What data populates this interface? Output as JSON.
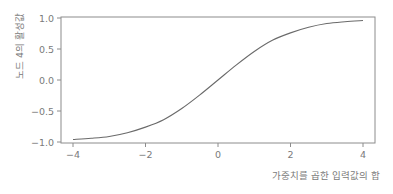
{
  "chart_data": {
    "type": "line",
    "title": "",
    "xlabel": "가중치를 곱한 입력값의 합",
    "ylabel": "노드 4의 활성값",
    "xlim": [
      -4.3,
      4.3
    ],
    "ylim": [
      -1.02,
      1.02
    ],
    "grid": false,
    "legend": null,
    "x_ticks": [
      -4,
      -2,
      0,
      2,
      4
    ],
    "x_tick_labels": [
      "−4",
      "−2",
      "0",
      "2",
      "4"
    ],
    "y_ticks": [
      1.0,
      0.5,
      0.0,
      -0.5,
      -1.0
    ],
    "y_tick_labels": [
      "1.0",
      "0.5",
      "0.0",
      "−0.5",
      "−1.0"
    ],
    "series": [
      {
        "name": "activation (tanh(x/2))",
        "x": [
          -4,
          -3.5,
          -3,
          -2.5,
          -2,
          -1.5,
          -1,
          -0.5,
          0,
          0.5,
          1,
          1.5,
          2,
          2.5,
          3,
          3.5,
          4
        ],
        "y": [
          -0.96,
          -0.94,
          -0.91,
          -0.85,
          -0.76,
          -0.64,
          -0.46,
          -0.24,
          0.0,
          0.24,
          0.46,
          0.64,
          0.76,
          0.85,
          0.91,
          0.94,
          0.96
        ]
      }
    ],
    "colors": {
      "line": "#6a6a6a",
      "axes": "#8c8c8c",
      "text": "#7a7a7a"
    }
  }
}
